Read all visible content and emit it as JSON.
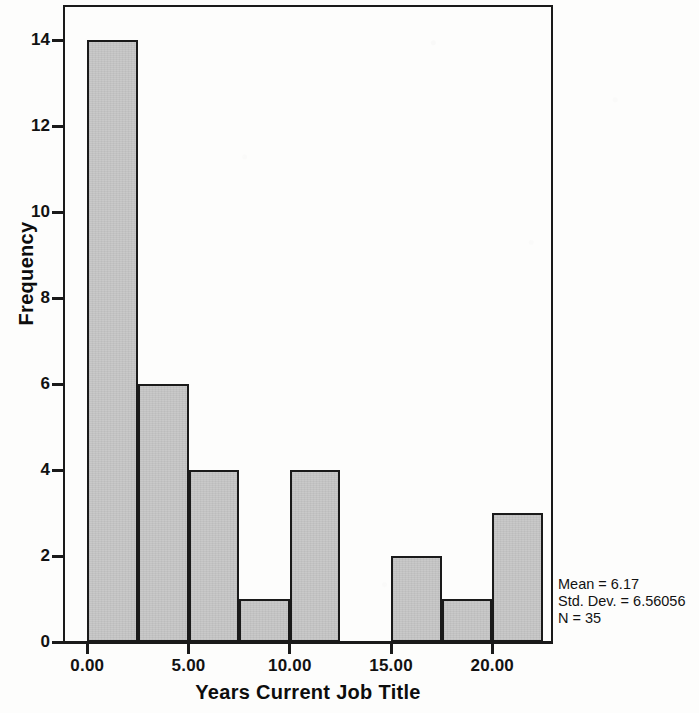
{
  "chart_data": {
    "type": "bar",
    "chart_subtype": "histogram",
    "title": "",
    "xlabel": "Years Current Job Title",
    "ylabel": "Frequency",
    "xlim": [
      -1.2,
      23.0
    ],
    "ylim": [
      0,
      14.82
    ],
    "grid": false,
    "legend": null,
    "bin_width": 2.5,
    "categories": [
      "0.0-2.5",
      "2.5-5.0",
      "5.0-7.5",
      "7.5-10.0",
      "10.0-12.5",
      "12.5-15.0",
      "15.0-17.5",
      "17.5-20.0",
      "20.0-22.5"
    ],
    "bin_edges": [
      0.0,
      2.5,
      5.0,
      7.5,
      10.0,
      12.5,
      15.0,
      17.5,
      20.0,
      22.5
    ],
    "values": [
      14,
      6,
      4,
      1,
      4,
      0,
      2,
      1,
      3
    ],
    "bars": [
      {
        "bin_start": 0.0,
        "bin_end": 2.5,
        "frequency": 14
      },
      {
        "bin_start": 2.5,
        "bin_end": 5.0,
        "frequency": 6
      },
      {
        "bin_start": 5.0,
        "bin_end": 7.5,
        "frequency": 4
      },
      {
        "bin_start": 7.5,
        "bin_end": 10.0,
        "frequency": 1
      },
      {
        "bin_start": 10.0,
        "bin_end": 12.5,
        "frequency": 4
      },
      {
        "bin_start": 12.5,
        "bin_end": 15.0,
        "frequency": 0
      },
      {
        "bin_start": 15.0,
        "bin_end": 17.5,
        "frequency": 2
      },
      {
        "bin_start": 17.5,
        "bin_end": 20.0,
        "frequency": 1
      },
      {
        "bin_start": 20.0,
        "bin_end": 22.5,
        "frequency": 3
      }
    ],
    "x_ticks": [
      {
        "value": 0,
        "label": "0.00"
      },
      {
        "value": 5,
        "label": "5.00"
      },
      {
        "value": 10,
        "label": "10.00"
      },
      {
        "value": 15,
        "label": "15.00"
      },
      {
        "value": 20,
        "label": "20.00"
      }
    ],
    "y_ticks": [
      {
        "value": 0,
        "label": "0"
      },
      {
        "value": 2,
        "label": "2"
      },
      {
        "value": 4,
        "label": "4"
      },
      {
        "value": 6,
        "label": "6"
      },
      {
        "value": 8,
        "label": "8"
      },
      {
        "value": 10,
        "label": "10"
      },
      {
        "value": 12,
        "label": "12"
      },
      {
        "value": 14,
        "label": "14"
      }
    ],
    "annotations": {
      "mean": "Mean = 6.17",
      "std_dev": "Std. Dev. = 6.56056",
      "n": "N = 35"
    },
    "colors": {
      "bar_fill": "#c9c9c9",
      "bar_outline": "#1a1a1a",
      "axis": "#1a1a1a",
      "text": "#121212",
      "background": "#fdfdfc"
    }
  }
}
